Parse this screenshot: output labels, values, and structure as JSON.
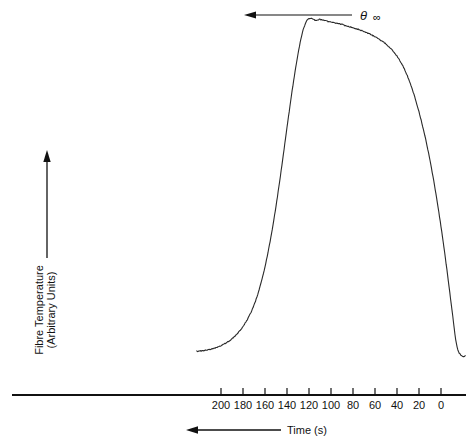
{
  "chart_data": {
    "type": "line",
    "title": "",
    "xlabel": "Time (s)",
    "ylabel": "Fibre Temperature (Arbitrary Units)",
    "ylabel_line1": "Fibre Temperature",
    "ylabel_line2": "(Arbitrary Units)",
    "x_axis_direction": "decreasing-left-to-right",
    "xlim": [
      220,
      -10
    ],
    "ylim": [
      0,
      100
    ],
    "grid": false,
    "legend": null,
    "xticks": [
      200,
      180,
      160,
      140,
      120,
      100,
      80,
      60,
      40,
      20,
      0
    ],
    "xtick_labels": [
      "200",
      "180",
      "160",
      "140",
      "120",
      "100",
      "80",
      "60",
      "40",
      "20",
      "0"
    ],
    "yticks": [],
    "ytick_labels": [],
    "annotations": [
      {
        "name": "theta-infinity",
        "symbol": "θ",
        "subscript": "∞",
        "text": "θ ∞",
        "points_to_x": 140,
        "points_to_y": 95,
        "leader_arrow": "left"
      }
    ],
    "series": [
      {
        "name": "fibre-temperature-trace",
        "color": "#2a2a2a",
        "x": [
          222,
          218,
          214,
          210,
          206,
          202,
          198,
          194,
          190,
          186,
          182,
          178,
          174,
          170,
          166,
          162,
          158,
          154,
          150,
          146,
          142,
          138,
          134,
          130,
          126,
          122,
          118,
          114,
          110,
          106,
          102,
          98,
          94,
          90,
          86,
          82,
          78,
          74,
          70,
          66,
          62,
          58,
          54,
          50,
          46,
          42,
          38,
          34,
          30,
          26,
          22,
          18,
          14,
          10,
          6,
          2,
          -2,
          -6,
          -10,
          -14,
          -18,
          -22
        ],
        "y": [
          5.5,
          5.6,
          5.8,
          6.0,
          6.4,
          6.8,
          7.4,
          8.1,
          9.0,
          10.2,
          11.6,
          13.4,
          15.6,
          18.4,
          22.0,
          26.5,
          32.0,
          38.5,
          46.0,
          54.5,
          63.5,
          72.5,
          81.0,
          88.5,
          94.5,
          97.8,
          98.4,
          98.0,
          98.2,
          97.9,
          97.6,
          97.4,
          97.1,
          96.8,
          96.4,
          96.1,
          95.7,
          95.3,
          94.8,
          94.3,
          93.7,
          93.0,
          92.2,
          91.3,
          90.2,
          88.8,
          87.0,
          84.8,
          82.0,
          78.6,
          74.6,
          70.0,
          64.8,
          58.8,
          52.0,
          44.4,
          36.0,
          26.8,
          17.0,
          7.6,
          4.4,
          4.2
        ]
      }
    ]
  },
  "axes": {
    "x_axis_arrow_direction": "left",
    "y_axis_arrow_direction": "up"
  },
  "colors": {
    "trace": "#2a2a2a",
    "axis": "#111111",
    "background": "#ffffff"
  }
}
